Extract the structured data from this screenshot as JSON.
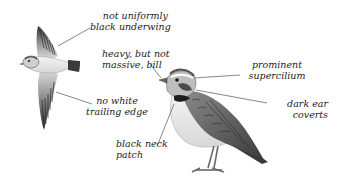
{
  "figure": {
    "birds": [
      {
        "id": "flying-bird",
        "pose": "in flight, underside view"
      },
      {
        "id": "perched-bird",
        "pose": "standing, side view"
      }
    ],
    "labels": [
      {
        "id": "underwing",
        "lines": [
          "not uniformly",
          "black underwing"
        ]
      },
      {
        "id": "trailing-edge",
        "lines": [
          "no white",
          "trailing edge"
        ]
      },
      {
        "id": "bill",
        "lines": [
          "heavy, but not",
          "massive, bill"
        ]
      },
      {
        "id": "supercilium",
        "lines": [
          "prominent",
          "supercilium"
        ]
      },
      {
        "id": "ear-coverts",
        "lines": [
          "dark ear",
          "coverts"
        ]
      },
      {
        "id": "neck-patch",
        "lines": [
          "black neck",
          "patch"
        ]
      }
    ]
  },
  "colors": {
    "background": "#ffffff",
    "text": "#222222",
    "leader": "#555555",
    "plumage_dark": "#3a3a3a",
    "plumage_mid": "#8a8a8a",
    "plumage_light": "#e6e6e6"
  }
}
